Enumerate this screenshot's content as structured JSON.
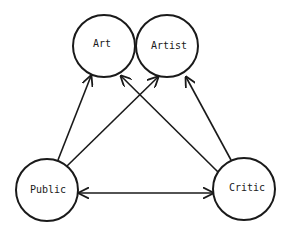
{
  "diagram": {
    "nodes": [
      {
        "id": "art",
        "label": "Art",
        "cx": 104,
        "cy": 46,
        "r": 31
      },
      {
        "id": "artist",
        "label": "Artist",
        "cx": 167,
        "cy": 46,
        "r": 31
      },
      {
        "id": "public",
        "label": "Public",
        "cx": 47,
        "cy": 190,
        "r": 31
      },
      {
        "id": "critic",
        "label": "Critic",
        "cx": 244,
        "cy": 189,
        "r": 31
      }
    ],
    "edges": [
      {
        "from": "public",
        "to": "art",
        "direction": "forward"
      },
      {
        "from": "public",
        "to": "artist",
        "direction": "forward"
      },
      {
        "from": "critic",
        "to": "art",
        "direction": "forward"
      },
      {
        "from": "critic",
        "to": "artist",
        "direction": "forward"
      },
      {
        "from": "public",
        "to": "critic",
        "direction": "both"
      }
    ],
    "stroke_color": "#1a1a1a",
    "background": "#ffffff"
  }
}
